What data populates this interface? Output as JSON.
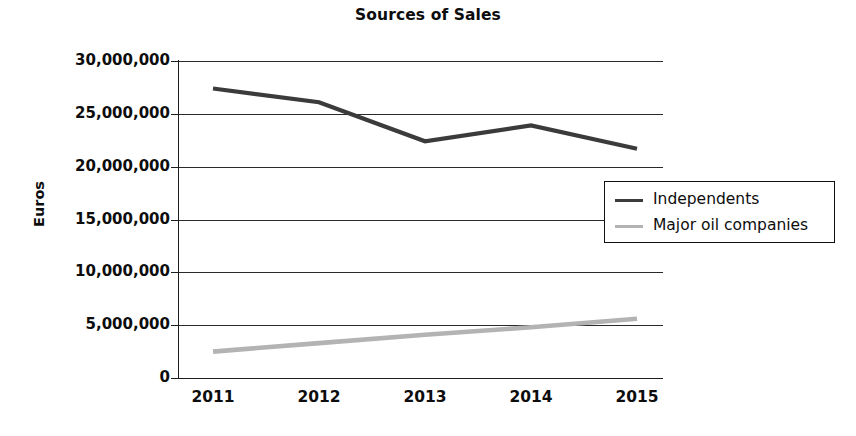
{
  "chart_data": {
    "type": "line",
    "title": "Sources of Sales",
    "xlabel": "",
    "ylabel": "Euros",
    "categories": [
      "2011",
      "2012",
      "2013",
      "2014",
      "2015"
    ],
    "ylim": [
      0,
      30000000
    ],
    "yticks": [
      0,
      5000000,
      10000000,
      15000000,
      20000000,
      25000000,
      30000000
    ],
    "ytick_labels": [
      "0",
      "5,000,000",
      "10,000,000",
      "15,000,000",
      "20,000,000",
      "25,000,000",
      "30,000,000"
    ],
    "grid": true,
    "legend_position": "center-right",
    "series": [
      {
        "name": "Independents",
        "color": "#3b3b3b",
        "values": [
          27400000,
          26100000,
          22400000,
          23900000,
          21700000
        ]
      },
      {
        "name": "Major oil companies",
        "color": "#b3b3b3",
        "values": [
          2500000,
          3300000,
          4100000,
          4800000,
          5600000
        ]
      }
    ]
  },
  "legend": {
    "items": [
      {
        "label": "Independents",
        "swatch": "dark"
      },
      {
        "label": "Major oil companies",
        "swatch": "light"
      }
    ]
  }
}
